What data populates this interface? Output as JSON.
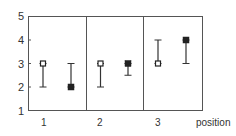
{
  "chart_data": {
    "type": "scatter",
    "title": "",
    "xlabel": "position",
    "ylabel": "",
    "ylim": [
      1,
      5
    ],
    "yticks": [
      1,
      2,
      3,
      4,
      5
    ],
    "categories": [
      "1",
      "2",
      "3"
    ],
    "grid": false,
    "legend": null,
    "series": [
      {
        "name": "open-square",
        "marker": "open",
        "values": [
          3,
          3,
          3
        ],
        "error_low": [
          2,
          2,
          3
        ],
        "error_high": [
          3,
          3,
          4
        ]
      },
      {
        "name": "filled-square",
        "marker": "filled",
        "values": [
          2,
          3,
          4
        ],
        "error_low": [
          2,
          2.5,
          3
        ],
        "error_high": [
          3,
          3,
          4
        ]
      }
    ]
  },
  "axis": {
    "y_labels": [
      "5",
      "4",
      "3",
      "2",
      "1"
    ],
    "x_labels": [
      "1",
      "2",
      "3"
    ],
    "x_title": "position"
  },
  "colors": {
    "axis": "#555555",
    "marker": "#222222",
    "errorbar": "#333333"
  }
}
